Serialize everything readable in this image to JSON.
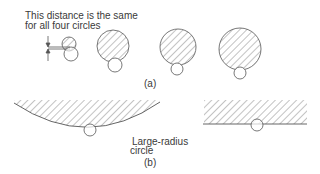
{
  "figure": {
    "annotation": {
      "line1": "This distance is the same",
      "line2": "for all four circles"
    },
    "part_a_label": "(a)",
    "part_b_label": "(b)",
    "large_radius_label": {
      "line1": "Large-radius",
      "line2": "circle"
    },
    "colors": {
      "stroke": "#555555",
      "hatch": "#777777",
      "background": "#ffffff"
    }
  }
}
